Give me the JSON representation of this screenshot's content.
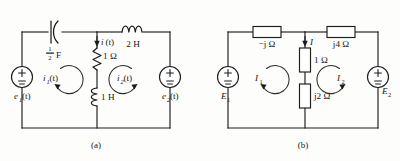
{
  "figure": {
    "type": "electrical-circuit-diagram",
    "panel_count": 2,
    "captions": {
      "a": "(a)",
      "b": "(b)"
    }
  },
  "circuit_a": {
    "caption": "(a)",
    "domain": "time-domain",
    "sources": [
      {
        "name": "e1",
        "label": "e",
        "subscript": "1",
        "arg": "(t)",
        "plus": "+",
        "minus": "−",
        "position": "left"
      },
      {
        "name": "e2",
        "label": "e",
        "subscript": "2",
        "arg": "(t)",
        "plus": "+",
        "minus": "−",
        "position": "right"
      }
    ],
    "components": [
      {
        "name": "capacitor",
        "symbol": "capacitor-polarized",
        "value_numerator": "1",
        "value_denominator": "2",
        "unit": "F",
        "label": "½ F",
        "branch": "top-left"
      },
      {
        "name": "inductor-2h",
        "symbol": "inductor-coil",
        "value": "2",
        "unit": "H",
        "label": "2 H",
        "branch": "top-right"
      },
      {
        "name": "resistor-1ohm",
        "symbol": "resistor-zigzag",
        "value": "1",
        "unit": "Ω",
        "label": "1 Ω",
        "branch": "middle-upper"
      },
      {
        "name": "inductor-1h",
        "symbol": "inductor-coil",
        "value": "1",
        "unit": "H",
        "label": "1 H",
        "branch": "middle-lower"
      }
    ],
    "currents": [
      {
        "name": "i",
        "label": "i",
        "subscript": "",
        "arg": "(t)",
        "kind": "branch-current",
        "direction": "down"
      },
      {
        "name": "i1",
        "label": "i",
        "subscript": "1",
        "arg": "(t)",
        "kind": "mesh-current",
        "direction": "clockwise"
      },
      {
        "name": "i2",
        "label": "i",
        "subscript": "2",
        "arg": "(t)",
        "kind": "mesh-current",
        "direction": "counterclockwise"
      }
    ]
  },
  "circuit_b": {
    "caption": "(b)",
    "domain": "phasor-domain",
    "sources": [
      {
        "name": "E1",
        "label": "E",
        "subscript": "1",
        "plus": "+",
        "minus": "−",
        "position": "left"
      },
      {
        "name": "E2",
        "label": "E",
        "subscript": "2",
        "plus": "+",
        "minus": "−",
        "position": "right"
      }
    ],
    "components": [
      {
        "name": "impedance-neg-j",
        "symbol": "impedance-box",
        "label": "−j Ω",
        "branch": "top-left"
      },
      {
        "name": "impedance-j4",
        "symbol": "impedance-box",
        "label": "j4 Ω",
        "branch": "top-right"
      },
      {
        "name": "impedance-1ohm",
        "symbol": "impedance-box",
        "label": "1 Ω",
        "branch": "middle-upper"
      },
      {
        "name": "impedance-j2",
        "symbol": "impedance-box",
        "label": "j2 Ω",
        "branch": "middle-lower"
      }
    ],
    "currents": [
      {
        "name": "I",
        "label": "I",
        "subscript": "",
        "kind": "branch-current",
        "direction": "down"
      },
      {
        "name": "I1",
        "label": "I",
        "subscript": "1",
        "kind": "mesh-current",
        "direction": "clockwise"
      },
      {
        "name": "I2",
        "label": "I",
        "subscript": "2",
        "kind": "mesh-current",
        "direction": "counterclockwise"
      }
    ]
  },
  "colors": {
    "background": "#fdfdfc",
    "ink": "#1c1c1c",
    "component_fill": "#ffffff"
  }
}
